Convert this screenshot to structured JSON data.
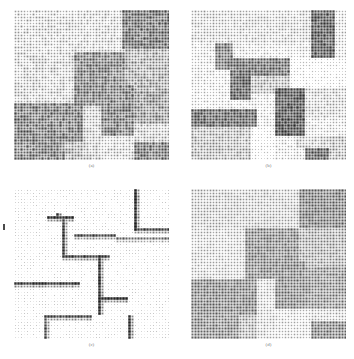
{
  "figure": {
    "title": "",
    "caption_style": "lowercase-letter-parenthesis",
    "background_color": "#ffffff",
    "panel_count": 4,
    "layout": "2x2"
  },
  "panels": [
    {
      "id": "a",
      "caption": "(a)",
      "position": "top-left",
      "description": "dense mid-gray dot matrix with piecewise-constant rectangular blocks",
      "marker_color": "#707070",
      "dot_grid_cols": 52,
      "dot_grid_rows": 50
    },
    {
      "id": "b",
      "caption": "(b)",
      "position": "top-right",
      "description": "sparse dark dot matrix with L-shaped block structures on light background",
      "marker_color": "#3a3a3a",
      "dot_grid_cols": 52,
      "dot_grid_rows": 50
    },
    {
      "id": "c",
      "caption": "(c)",
      "position": "bottom-left",
      "description": "very light background with dark dots tracing region boundaries / edges",
      "marker_color": "#1a1a1a",
      "dot_grid_cols": 52,
      "dot_grid_rows": 50
    },
    {
      "id": "d",
      "caption": "(d)",
      "position": "bottom-right",
      "description": "dense gray dot matrix with clean rectangular piecewise-constant regions",
      "marker_color": "#6a6a6a",
      "dot_grid_cols": 52,
      "dot_grid_rows": 50
    }
  ],
  "chart_data": {
    "type": "heatmap",
    "title": "",
    "subtitle": "",
    "xlabel": "",
    "ylabel": "",
    "grid": false,
    "legend_position": "none",
    "render": "hinton-diagram",
    "marker_shape": "square",
    "cell_size_px": 3,
    "grid_cols": 52,
    "grid_rows": 50,
    "value_range": [
      0,
      1
    ],
    "panels": [
      {
        "id": "a",
        "caption": "(a)",
        "base_level": 0.42,
        "noise_amplitude": 0.09,
        "regions": [
          {
            "x0": 0,
            "y0": 0,
            "x1": 52,
            "y1": 50,
            "value": 0.4
          },
          {
            "x0": 0,
            "y0": 0,
            "x1": 36,
            "y1": 14,
            "value": 0.3
          },
          {
            "x0": 36,
            "y0": 0,
            "x1": 52,
            "y1": 13,
            "value": 0.62
          },
          {
            "x0": 0,
            "y0": 14,
            "x1": 20,
            "y1": 31,
            "value": 0.32
          },
          {
            "x0": 20,
            "y0": 14,
            "x1": 37,
            "y1": 32,
            "value": 0.58
          },
          {
            "x0": 37,
            "y0": 13,
            "x1": 52,
            "y1": 27,
            "value": 0.46
          },
          {
            "x0": 37,
            "y0": 27,
            "x1": 52,
            "y1": 38,
            "value": 0.52
          },
          {
            "x0": 28,
            "y0": 25,
            "x1": 40,
            "y1": 42,
            "value": 0.6
          },
          {
            "x0": 0,
            "y0": 31,
            "x1": 23,
            "y1": 44,
            "value": 0.6
          },
          {
            "x0": 23,
            "y0": 32,
            "x1": 29,
            "y1": 50,
            "value": 0.34
          },
          {
            "x0": 40,
            "y0": 38,
            "x1": 52,
            "y1": 44,
            "value": 0.34
          },
          {
            "x0": 29,
            "y0": 42,
            "x1": 40,
            "y1": 50,
            "value": 0.3
          },
          {
            "x0": 40,
            "y0": 44,
            "x1": 52,
            "y1": 50,
            "value": 0.6
          },
          {
            "x0": 0,
            "y0": 44,
            "x1": 17,
            "y1": 50,
            "value": 0.58
          },
          {
            "x0": 17,
            "y0": 44,
            "x1": 23,
            "y1": 50,
            "value": 0.44
          }
        ]
      },
      {
        "id": "b",
        "caption": "(b)",
        "base_level": 0.26,
        "noise_amplitude": 0.07,
        "regions": [
          {
            "x0": 0,
            "y0": 0,
            "x1": 52,
            "y1": 50,
            "value": 0.24
          },
          {
            "x0": 0,
            "y0": 0,
            "x1": 40,
            "y1": 11,
            "value": 0.3
          },
          {
            "x0": 40,
            "y0": 0,
            "x1": 48,
            "y1": 16,
            "value": 0.68
          },
          {
            "x0": 48,
            "y0": 0,
            "x1": 52,
            "y1": 16,
            "value": 0.26
          },
          {
            "x0": 8,
            "y0": 11,
            "x1": 14,
            "y1": 20,
            "value": 0.6
          },
          {
            "x0": 14,
            "y0": 16,
            "x1": 33,
            "y1": 22,
            "value": 0.62
          },
          {
            "x0": 33,
            "y0": 16,
            "x1": 52,
            "y1": 26,
            "value": 0.14
          },
          {
            "x0": 13,
            "y0": 20,
            "x1": 20,
            "y1": 30,
            "value": 0.66
          },
          {
            "x0": 20,
            "y0": 22,
            "x1": 33,
            "y1": 28,
            "value": 0.4
          },
          {
            "x0": 0,
            "y0": 22,
            "x1": 13,
            "y1": 33,
            "value": 0.22
          },
          {
            "x0": 28,
            "y0": 26,
            "x1": 38,
            "y1": 42,
            "value": 0.7
          },
          {
            "x0": 38,
            "y0": 26,
            "x1": 52,
            "y1": 36,
            "value": 0.32
          },
          {
            "x0": 0,
            "y0": 33,
            "x1": 22,
            "y1": 39,
            "value": 0.66
          },
          {
            "x0": 0,
            "y0": 39,
            "x1": 20,
            "y1": 50,
            "value": 0.4
          },
          {
            "x0": 28,
            "y0": 36,
            "x1": 35,
            "y1": 42,
            "value": 0.72
          },
          {
            "x0": 20,
            "y0": 39,
            "x1": 28,
            "y1": 50,
            "value": 0.14
          },
          {
            "x0": 35,
            "y0": 42,
            "x1": 46,
            "y1": 46,
            "value": 0.34
          },
          {
            "x0": 46,
            "y0": 42,
            "x1": 52,
            "y1": 50,
            "value": 0.4
          },
          {
            "x0": 38,
            "y0": 46,
            "x1": 46,
            "y1": 50,
            "value": 0.66
          }
        ]
      },
      {
        "id": "c",
        "caption": "(c)",
        "base_level": 0.1,
        "noise_amplitude": 0.06,
        "regions": [
          {
            "x0": 0,
            "y0": 0,
            "x1": 52,
            "y1": 50,
            "value": 0.08
          }
        ],
        "edges": [
          {
            "type": "v",
            "x": 40,
            "y0": 0,
            "y1": 14,
            "value": 0.82
          },
          {
            "type": "h",
            "x0": 40,
            "x1": 52,
            "y": 13,
            "value": 0.72
          },
          {
            "type": "v",
            "x": 14,
            "y0": 8,
            "y1": 10,
            "value": 0.8
          },
          {
            "type": "h",
            "x0": 11,
            "x1": 20,
            "y": 9,
            "value": 0.78
          },
          {
            "type": "v",
            "x": 16,
            "y0": 9,
            "y1": 22,
            "value": 0.76
          },
          {
            "type": "h",
            "x0": 20,
            "x1": 34,
            "y": 15,
            "value": 0.7
          },
          {
            "type": "h",
            "x0": 16,
            "x1": 32,
            "y": 22,
            "value": 0.74
          },
          {
            "type": "v",
            "x": 28,
            "y0": 22,
            "y1": 42,
            "value": 0.8
          },
          {
            "type": "h",
            "x0": 0,
            "x1": 22,
            "y": 31,
            "value": 0.76
          },
          {
            "type": "h",
            "x0": 28,
            "x1": 38,
            "y": 36,
            "value": 0.8
          },
          {
            "type": "h",
            "x0": 10,
            "x1": 26,
            "y": 42,
            "value": 0.7
          },
          {
            "type": "v",
            "x": 38,
            "y0": 42,
            "y1": 50,
            "value": 0.78
          },
          {
            "type": "v",
            "x": 10,
            "y0": 43,
            "y1": 50,
            "value": 0.68
          },
          {
            "type": "h",
            "x0": 34,
            "x1": 52,
            "y": 16,
            "value": 0.56
          }
        ]
      },
      {
        "id": "d",
        "caption": "(d)",
        "base_level": 0.4,
        "noise_amplitude": 0.05,
        "regions": [
          {
            "x0": 0,
            "y0": 0,
            "x1": 52,
            "y1": 50,
            "value": 0.38
          },
          {
            "x0": 0,
            "y0": 0,
            "x1": 36,
            "y1": 13,
            "value": 0.34
          },
          {
            "x0": 36,
            "y0": 0,
            "x1": 52,
            "y1": 13,
            "value": 0.58
          },
          {
            "x0": 0,
            "y0": 13,
            "x1": 18,
            "y1": 30,
            "value": 0.3
          },
          {
            "x0": 18,
            "y0": 13,
            "x1": 36,
            "y1": 30,
            "value": 0.55
          },
          {
            "x0": 36,
            "y0": 13,
            "x1": 52,
            "y1": 26,
            "value": 0.44
          },
          {
            "x0": 36,
            "y0": 26,
            "x1": 52,
            "y1": 40,
            "value": 0.52
          },
          {
            "x0": 26,
            "y0": 24,
            "x1": 38,
            "y1": 40,
            "value": 0.56
          },
          {
            "x0": 0,
            "y0": 30,
            "x1": 22,
            "y1": 42,
            "value": 0.56
          },
          {
            "x0": 22,
            "y0": 30,
            "x1": 28,
            "y1": 50,
            "value": 0.3
          },
          {
            "x0": 28,
            "y0": 40,
            "x1": 40,
            "y1": 50,
            "value": 0.26
          },
          {
            "x0": 40,
            "y0": 40,
            "x1": 52,
            "y1": 44,
            "value": 0.3
          },
          {
            "x0": 40,
            "y0": 44,
            "x1": 52,
            "y1": 50,
            "value": 0.56
          },
          {
            "x0": 0,
            "y0": 42,
            "x1": 16,
            "y1": 50,
            "value": 0.54
          },
          {
            "x0": 16,
            "y0": 42,
            "x1": 22,
            "y1": 50,
            "value": 0.42
          }
        ]
      }
    ]
  }
}
